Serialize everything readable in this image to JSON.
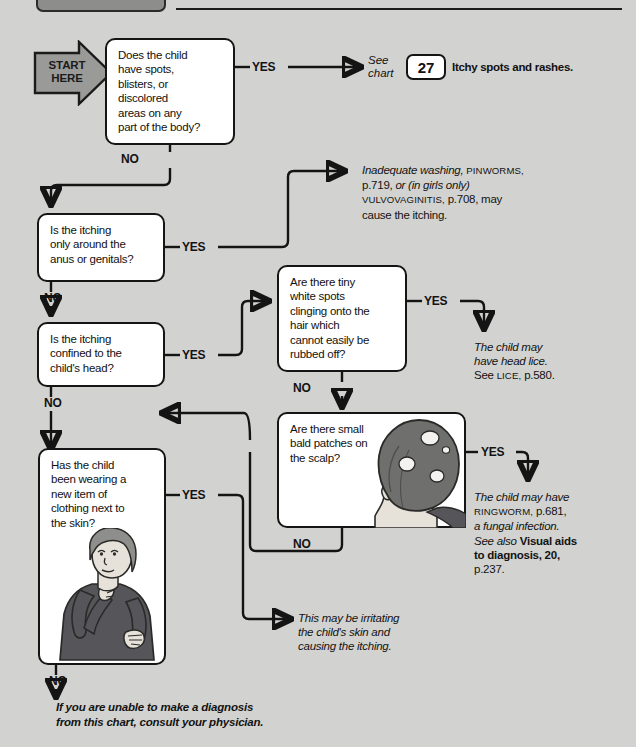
{
  "header": {
    "pill_label": "",
    "rule_label": ""
  },
  "start": {
    "label": "START\nHERE"
  },
  "labels": {
    "yes": "YES",
    "no": "NO"
  },
  "boxes": [
    {
      "id": "spots-blisters",
      "text": "Does the child\nhave spots,\nblisters, or\ndiscolored\nareas on any\npart of the body?"
    },
    {
      "id": "anus-genitals",
      "text": "Is the itching\nonly around the\nanus or genitals?"
    },
    {
      "id": "confined-head",
      "text": "Is the itching\nconfined to the\nchild's head?"
    },
    {
      "id": "white-spots-hair",
      "text": "Are there tiny\nwhite spots\nclinging onto the\nhair which\ncannot easily be\nrubbed off?"
    },
    {
      "id": "bald-patches",
      "text": "Are there small\nbald patches on\nthe scalp?"
    },
    {
      "id": "new-clothing",
      "text": "Has the child\nbeen wearing a\nnew item of\nclothing next to\nthe skin?"
    }
  ],
  "chart_ref": {
    "see": "See",
    "chart": "chart",
    "number": "27",
    "title": "Itchy spots and rashes."
  },
  "outcomes": {
    "washing": {
      "line1_italic": "Inadequate washing,",
      "line1_sc": "PINWORMS,",
      "line2_a": "p.719,",
      "line2_italic": "or (in girls only)",
      "line3_sc": "VULVOVAGINITIS,",
      "line3_a": "p.708, may",
      "line4": "cause the itching."
    },
    "head_lice": {
      "line1": "The child may",
      "line2": "have head lice.",
      "line3_a": "See",
      "line3_sc": "LICE,",
      "line3_b": "p.580."
    },
    "ringworm": {
      "line1": "The child may have",
      "line2_sc": "RINGWORM,",
      "line2_a": "p.681,",
      "line3": "a fungal infection.",
      "line4_a": "See also",
      "line4_b": "Visual aids",
      "line5_b": "to diagnosis, 20,",
      "line6_a": "p.237."
    },
    "irritating": {
      "line1": "This may be irritating",
      "line2": "the child's skin and",
      "line3": "causing the itching."
    }
  },
  "footer": {
    "line1": "If you are unable to make a diagnosis",
    "line2": "from this chart, consult your physician."
  },
  "illustrations": {
    "bald_head": "back-of-head-with-bald-patches",
    "child_scratching": "child-scratching-neck"
  },
  "colors": {
    "page_bg": "#d2d2d0",
    "box_bg": "#ffffff",
    "ink": "#141414",
    "arrow_gray": "#9a9a98",
    "hair_dark": "#6f6f6d",
    "skin": "#e2ded6",
    "sweater": "#55555a"
  }
}
